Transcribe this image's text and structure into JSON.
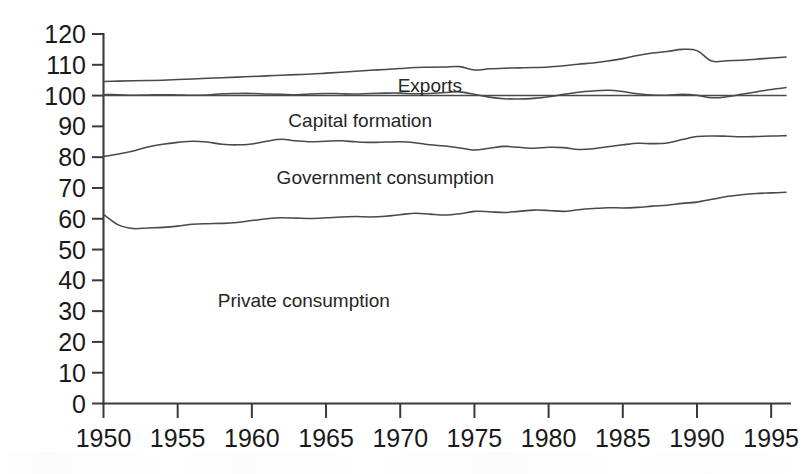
{
  "chart_data": {
    "type": "line",
    "title": "",
    "subtitle": "",
    "xlabel": "",
    "ylabel": "",
    "xlim": [
      1950,
      1996
    ],
    "ylim": [
      0,
      120
    ],
    "grid": false,
    "legend_position": "inline-annotations",
    "y_ticks": [
      0,
      10,
      20,
      30,
      40,
      50,
      60,
      70,
      80,
      90,
      100,
      110,
      120
    ],
    "x_ticks": [
      1950,
      1955,
      1960,
      1965,
      1970,
      1975,
      1980,
      1985,
      1990,
      1995
    ],
    "annotations": [
      {
        "text": "Exports",
        "x": 1972.0,
        "y": 103.5
      },
      {
        "text": "Capital formation",
        "x": 1967.3,
        "y": 92.0
      },
      {
        "text": "Government consumption",
        "x": 1969.0,
        "y": 73.5
      },
      {
        "text": "Private consumption",
        "x": 1963.5,
        "y": 33.5
      }
    ],
    "series": [
      {
        "name": "Exports (cumulative top boundary)",
        "x": [
          1950,
          1951,
          1952,
          1953,
          1954,
          1955,
          1956,
          1957,
          1958,
          1959,
          1960,
          1961,
          1962,
          1963,
          1964,
          1965,
          1966,
          1967,
          1968,
          1969,
          1970,
          1971,
          1972,
          1973,
          1974,
          1975,
          1976,
          1977,
          1978,
          1979,
          1980,
          1981,
          1982,
          1983,
          1984,
          1985,
          1986,
          1987,
          1988,
          1989,
          1990,
          1991,
          1992,
          1993,
          1994,
          1995,
          1996
        ],
        "values": [
          104.6,
          104.7,
          104.8,
          104.9,
          105.0,
          105.2,
          105.4,
          105.6,
          105.8,
          106.0,
          106.2,
          106.4,
          106.6,
          106.8,
          107.0,
          107.3,
          107.6,
          107.9,
          108.2,
          108.5,
          108.8,
          109.1,
          109.2,
          109.3,
          109.4,
          108.3,
          108.7,
          108.9,
          109.0,
          109.1,
          109.3,
          109.7,
          110.2,
          110.6,
          111.2,
          112.0,
          113.0,
          113.8,
          114.3,
          115.0,
          114.6,
          111.2,
          111.3,
          111.5,
          111.8,
          112.2,
          112.5
        ]
      },
      {
        "name": "Reference level 100",
        "x": [
          1950,
          1996
        ],
        "values": [
          100.0,
          100.0
        ]
      },
      {
        "name": "Imports / balancing boundary",
        "x": [
          1950,
          1951,
          1952,
          1953,
          1954,
          1955,
          1956,
          1957,
          1958,
          1959,
          1960,
          1961,
          1962,
          1963,
          1964,
          1965,
          1966,
          1967,
          1968,
          1969,
          1970,
          1971,
          1972,
          1973,
          1974,
          1975,
          1976,
          1977,
          1978,
          1979,
          1980,
          1981,
          1982,
          1983,
          1984,
          1985,
          1986,
          1987,
          1988,
          1989,
          1990,
          1991,
          1992,
          1993,
          1994,
          1995,
          1996
        ],
        "values": [
          100.3,
          100.3,
          100.1,
          100.2,
          100.3,
          100.2,
          100.1,
          100.2,
          100.6,
          100.7,
          100.7,
          100.5,
          100.4,
          100.3,
          100.5,
          100.7,
          100.6,
          100.5,
          100.7,
          100.8,
          100.8,
          100.6,
          100.7,
          101.0,
          101.2,
          100.4,
          99.5,
          99.0,
          98.9,
          99.1,
          99.6,
          100.4,
          101.1,
          101.5,
          101.7,
          101.3,
          100.6,
          100.2,
          100.1,
          100.4,
          100.1,
          99.3,
          99.6,
          100.4,
          101.2,
          102.0,
          102.6
        ]
      },
      {
        "name": "Capital formation (cumulative boundary)",
        "x": [
          1950,
          1951,
          1952,
          1953,
          1954,
          1955,
          1956,
          1957,
          1958,
          1959,
          1960,
          1961,
          1962,
          1963,
          1964,
          1965,
          1966,
          1967,
          1968,
          1969,
          1970,
          1971,
          1972,
          1973,
          1974,
          1975,
          1976,
          1977,
          1978,
          1979,
          1980,
          1981,
          1982,
          1983,
          1984,
          1985,
          1986,
          1987,
          1988,
          1989,
          1990,
          1991,
          1992,
          1993,
          1994,
          1995,
          1996
        ],
        "values": [
          80.2,
          81.0,
          82.0,
          83.3,
          84.2,
          84.8,
          85.2,
          84.9,
          84.2,
          84.0,
          84.3,
          85.2,
          85.8,
          85.3,
          85.0,
          85.2,
          85.3,
          85.0,
          84.8,
          84.9,
          85.0,
          84.7,
          84.0,
          83.6,
          83.0,
          82.3,
          82.9,
          83.5,
          83.2,
          82.9,
          83.2,
          83.1,
          82.5,
          82.7,
          83.4,
          84.0,
          84.5,
          84.4,
          84.6,
          85.7,
          86.7,
          86.9,
          86.8,
          86.6,
          86.7,
          86.9,
          87.0
        ]
      },
      {
        "name": "Government consumption (cumulative boundary)",
        "x": [
          1950,
          1951,
          1952,
          1953,
          1954,
          1955,
          1956,
          1957,
          1958,
          1959,
          1960,
          1961,
          1962,
          1963,
          1964,
          1965,
          1966,
          1967,
          1968,
          1969,
          1970,
          1971,
          1972,
          1973,
          1974,
          1975,
          1976,
          1977,
          1978,
          1979,
          1980,
          1981,
          1982,
          1983,
          1984,
          1985,
          1986,
          1987,
          1988,
          1989,
          1990,
          1991,
          1992,
          1993,
          1994,
          1995,
          1996
        ],
        "values": [
          61.4,
          58.0,
          56.8,
          57.0,
          57.2,
          57.6,
          58.2,
          58.4,
          58.5,
          58.8,
          59.4,
          60.0,
          60.3,
          60.2,
          60.1,
          60.3,
          60.6,
          60.7,
          60.6,
          60.8,
          61.3,
          61.8,
          61.5,
          61.2,
          61.6,
          62.4,
          62.3,
          62.0,
          62.4,
          62.8,
          62.7,
          62.4,
          62.9,
          63.3,
          63.6,
          63.5,
          63.7,
          64.1,
          64.4,
          65.0,
          65.4,
          66.3,
          67.2,
          67.8,
          68.2,
          68.4,
          68.6
        ]
      },
      {
        "name": "Private consumption (area below government boundary)",
        "x": [],
        "values": []
      }
    ]
  },
  "axes": {
    "y": {
      "labels": [
        "120",
        "110",
        "100",
        "90",
        "80",
        "70",
        "60",
        "50",
        "40",
        "30",
        "20",
        "10",
        "0"
      ]
    },
    "x": {
      "labels": [
        "1950",
        "1955",
        "1960",
        "1965",
        "1970",
        "1975",
        "1980",
        "1985",
        "1990",
        "1995"
      ]
    }
  },
  "labels": {
    "exports": "Exports",
    "capital_formation": "Capital formation",
    "government_consumption": "Government consumption",
    "private_consumption": "Private consumption"
  },
  "colors": {
    "line": "#4a4a4a",
    "axis": "#3a3a3a",
    "text": "#1a1a1a",
    "background": "#ffffff"
  }
}
